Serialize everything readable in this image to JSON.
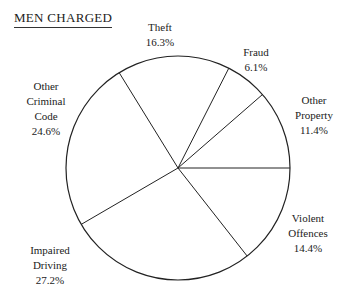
{
  "chart_data": {
    "type": "pie",
    "title": "MEN CHARGED",
    "categories": [
      "Other Property",
      "Fraud",
      "Theft",
      "Other Criminal Code",
      "Impaired Driving",
      "Violent Offences"
    ],
    "values": [
      11.4,
      6.1,
      16.3,
      24.6,
      27.2,
      14.4
    ],
    "unit": "%",
    "start_angle_deg": 0,
    "direction": "counterclockwise",
    "legend": "none (direct labels)"
  },
  "title": "MEN CHARGED",
  "labels": {
    "theft": {
      "line1": "Theft",
      "pct": "16.3%"
    },
    "fraud": {
      "line1": "Fraud",
      "pct": "6.1%"
    },
    "other_property": {
      "line1": "Other",
      "line2": "Property",
      "pct": "11.4%"
    },
    "violent": {
      "line1": "Violent",
      "line2": "Offences",
      "pct": "14.4%"
    },
    "impaired": {
      "line1": "Impaired",
      "line2": "Driving",
      "pct": "27.2%"
    },
    "other_criminal": {
      "line1": "Other",
      "line2": "Criminal",
      "line3": "Code",
      "pct": "24.6%"
    }
  }
}
